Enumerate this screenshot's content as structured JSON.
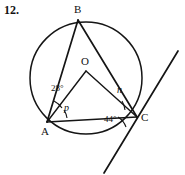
{
  "figure": {
    "problem_number": "12.",
    "type": "circle-geometry-diagram",
    "stroke_color": "#151515",
    "background_color": "#ffffff"
  },
  "circle": {
    "center_label": "O",
    "center_x": 86,
    "center_y": 78,
    "radius": 56
  },
  "vertices": [
    {
      "label": "B",
      "x": 78,
      "y": 20,
      "on_circle": true
    },
    {
      "label": "A",
      "x": 47,
      "y": 122,
      "on_circle": true
    },
    {
      "label": "C",
      "x": 137,
      "y": 117,
      "on_circle": true
    },
    {
      "label": "O",
      "x": 86,
      "y": 72,
      "on_circle": false
    }
  ],
  "segments": [
    {
      "name": "chord-AB",
      "from": "A",
      "to": "B"
    },
    {
      "name": "chord-BC",
      "from": "B",
      "to": "C"
    },
    {
      "name": "chord-AC",
      "from": "A",
      "to": "C"
    },
    {
      "name": "radius-OA",
      "from": "O",
      "to": "A"
    },
    {
      "name": "radius-OC",
      "from": "O",
      "to": "C"
    }
  ],
  "tangent_line": {
    "name": "tangent-at-C",
    "through": "C",
    "x1": 104,
    "y1": 173,
    "x2": 178,
    "y2": 51
  },
  "angle_labels": [
    {
      "name": "angle-bao",
      "text": "28°",
      "vertex": "A",
      "value": 28,
      "unit": "degrees"
    },
    {
      "name": "angle-oac",
      "text": "p",
      "vertex": "A",
      "unknown": true
    },
    {
      "name": "angle-oca",
      "text": "n",
      "vertex": "C",
      "unknown": true
    },
    {
      "name": "angle-tangent-ac",
      "text": "44°",
      "vertex": "C",
      "value": 44,
      "unit": "degrees"
    }
  ]
}
